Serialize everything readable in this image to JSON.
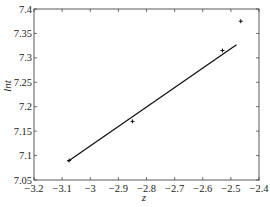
{
  "chart_data": {
    "type": "scatter",
    "title": "",
    "xlabel": "z",
    "ylabel": "lnt",
    "xlim": [
      -3.2,
      -2.4
    ],
    "ylim": [
      7.05,
      7.4
    ],
    "x_ticks": [
      -3.2,
      -3.1,
      -3.0,
      -2.9,
      -2.8,
      -2.7,
      -2.6,
      -2.5,
      -2.4
    ],
    "x_tick_labels": [
      "-3.2",
      "-3.1",
      "-3",
      "-2.9",
      "-2.8",
      "-2.7",
      "-2.6",
      "-2.5",
      "-2.4"
    ],
    "y_ticks": [
      7.05,
      7.1,
      7.15,
      7.2,
      7.25,
      7.3,
      7.35,
      7.4
    ],
    "y_tick_labels": [
      "7.05",
      "7.1",
      "7.15",
      "7.2",
      "7.25",
      "7.3",
      "7.35",
      "7.4"
    ],
    "grid": false,
    "legend": null,
    "series": [
      {
        "name": "data",
        "style": "markers",
        "marker": "+",
        "x": [
          -3.075,
          -2.85,
          -2.53,
          -2.465
        ],
        "y": [
          7.09,
          7.17,
          7.315,
          7.375
        ]
      },
      {
        "name": "linear fit",
        "style": "line",
        "x": [
          -3.08,
          -2.48
        ],
        "y": [
          7.088,
          7.327
        ]
      }
    ]
  },
  "colors": {
    "axis": "#333333",
    "line": "#111111",
    "marker": "#111111",
    "background": "#ffffff"
  }
}
